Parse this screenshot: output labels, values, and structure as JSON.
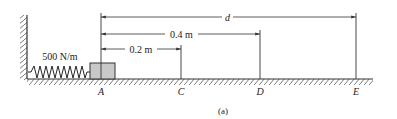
{
  "figure": {
    "caption": "(a)",
    "spring": {
      "label": "500 N/m"
    },
    "points": [
      {
        "id": "A",
        "label": "A",
        "x": 101
      },
      {
        "id": "C",
        "label": "C",
        "x": 181
      },
      {
        "id": "D",
        "label": "D",
        "x": 260
      },
      {
        "id": "E",
        "label": "E",
        "x": 356
      }
    ],
    "dimensions": [
      {
        "id": "d",
        "label": "d",
        "to": "E"
      },
      {
        "id": "0.4",
        "label": "0.4 m",
        "to": "D"
      },
      {
        "id": "0.2",
        "label": "0.2 m",
        "to": "C"
      }
    ],
    "colors": {
      "line": "#333333",
      "block_fill": "#c8c8c8",
      "hatch": "#444444"
    }
  }
}
